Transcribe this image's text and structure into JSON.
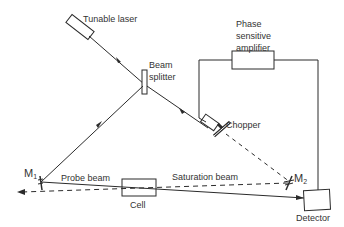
{
  "diagram": {
    "type": "saturation spectroscopy optical setup",
    "colors": {
      "line": "#2b2b2b",
      "text": "#333333",
      "background": "#ffffff"
    },
    "components": {
      "tunable_laser": {
        "label": "Tunable laser"
      },
      "beam_splitter": {
        "label_line1": "Beam",
        "label_line2": "splitter"
      },
      "phase_sensitive_amplifier": {
        "label_line1": "Phase",
        "label_line2": "sensitive",
        "label_line3": "amplifier"
      },
      "chopper": {
        "label": "Chopper"
      },
      "mirror_1": {
        "label": "M",
        "subscript": "1"
      },
      "mirror_2": {
        "label": "M",
        "subscript": "2"
      },
      "cell": {
        "label": "Cell"
      },
      "detector": {
        "label": "Detector"
      }
    },
    "beams": {
      "probe": {
        "label": "Probe beam",
        "style": "solid"
      },
      "saturation": {
        "label": "Saturation beam",
        "style": "dashed"
      }
    }
  }
}
